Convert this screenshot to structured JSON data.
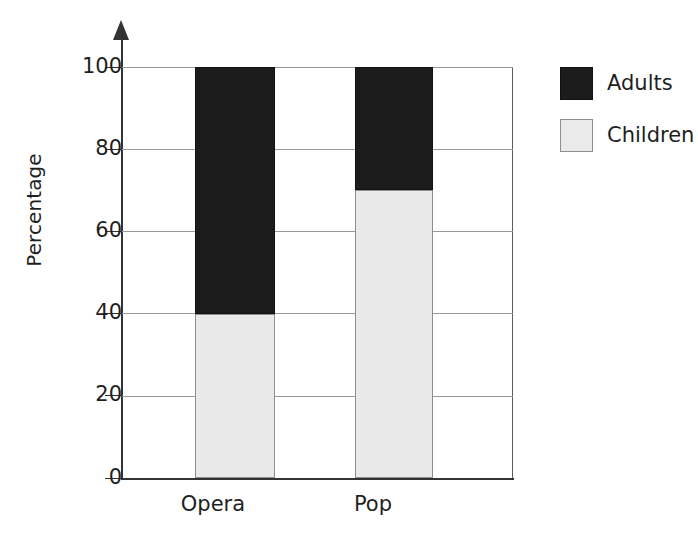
{
  "chart_data": {
    "type": "bar",
    "subtype": "stacked-bar-100-percent",
    "title": "",
    "subtitle": "",
    "xlabel": "",
    "ylabel": "Percentage",
    "categories": [
      "Opera",
      "Pop"
    ],
    "series": [
      {
        "name": "Children",
        "values": [
          40,
          70
        ],
        "color": "#e9e9e9"
      },
      {
        "name": "Adults",
        "values": [
          60,
          30
        ],
        "color": "#1c1c1c"
      }
    ],
    "stack_order": [
      "Children",
      "Adults"
    ],
    "ylim": [
      0,
      100
    ],
    "yticks": [
      0,
      20,
      40,
      60,
      80,
      100
    ],
    "ytick_labels": [
      "0",
      "20",
      "40",
      "60",
      "80",
      "100"
    ],
    "ytick_step": 20,
    "grid": true,
    "grid_axis": "y",
    "legend_position": "right",
    "legend_entries": [
      "Adults",
      "Children"
    ],
    "y_axis_arrow": true,
    "annotations": []
  },
  "axes": {
    "y_title": "Percentage",
    "y_tick_labels": [
      "100",
      "80",
      "60",
      "40",
      "20",
      "0"
    ],
    "x_tick_labels": [
      "Opera",
      "Pop"
    ]
  },
  "legend": {
    "items": [
      {
        "label": "Adults",
        "color": "#1c1c1c"
      },
      {
        "label": "Children",
        "color": "#e9e9e9"
      }
    ]
  },
  "colors": {
    "adults": "#1c1c1c",
    "children": "#e9e9e9",
    "axis": "#333333",
    "grid": "#9a9a9a",
    "text": "#1f1f1f",
    "background": "#ffffff"
  }
}
